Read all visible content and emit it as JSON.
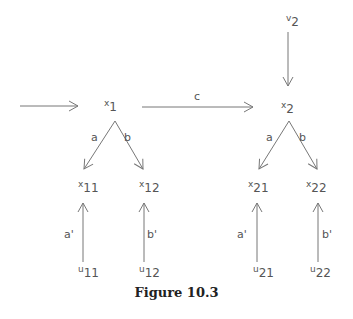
{
  "figure": {
    "caption": "Figure 10.3",
    "nodes": {
      "x1": {
        "base": "x",
        "sub": "1"
      },
      "x2": {
        "base": "x",
        "sub": "2"
      },
      "v2": {
        "base": "v",
        "sub": "2"
      },
      "x11": {
        "base": "x",
        "sub": "11"
      },
      "x12": {
        "base": "x",
        "sub": "12"
      },
      "x21": {
        "base": "x",
        "sub": "21"
      },
      "x22": {
        "base": "x",
        "sub": "22"
      },
      "u11": {
        "base": "u",
        "sub": "11"
      },
      "u12": {
        "base": "u",
        "sub": "12"
      },
      "u21": {
        "base": "u",
        "sub": "21"
      },
      "u22": {
        "base": "u",
        "sub": "22"
      }
    },
    "edge_labels": {
      "c": "c",
      "a_left": "a",
      "b_left": "b",
      "a_right": "a",
      "b_right": "b",
      "a_prime_left": "a'",
      "b_prime_left": "b'",
      "a_prime_right": "a'",
      "b_prime_right": "b'"
    },
    "colors": {
      "line": "#777777",
      "text": "#555555",
      "caption": "#222222"
    }
  }
}
